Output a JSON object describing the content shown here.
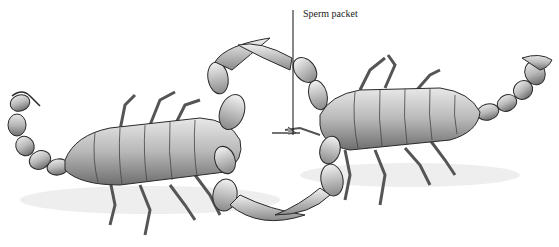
{
  "figure": {
    "annotation": {
      "label": "Sperm packet",
      "pointer_x": 293,
      "pointer_y_top": 10,
      "pointer_y_bottom": 135
    },
    "colors": {
      "background": "#ffffff",
      "ink": "#2a2a2a",
      "shade": "#9a9a9a",
      "light": "#d8d8d8"
    }
  }
}
